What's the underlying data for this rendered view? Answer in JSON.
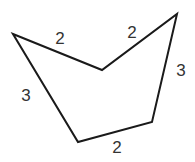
{
  "figure": {
    "type": "concave-pentagon",
    "stroke_color": "#1a1a1a",
    "label_color": "#333333",
    "background": "#ffffff",
    "vertices": [
      {
        "name": "left",
        "x": 13,
        "y": 34
      },
      {
        "name": "notch",
        "x": 102,
        "y": 70
      },
      {
        "name": "top-right",
        "x": 177,
        "y": 14
      },
      {
        "name": "bottom-right",
        "x": 152,
        "y": 122
      },
      {
        "name": "bottom-left",
        "x": 78,
        "y": 142
      }
    ],
    "sides": [
      {
        "id": "top-left",
        "from": "left",
        "to": "notch",
        "length": "2",
        "label_x": 60,
        "label_y": 38
      },
      {
        "id": "top-right",
        "from": "notch",
        "to": "top-right",
        "length": "2",
        "label_x": 132,
        "label_y": 32
      },
      {
        "id": "right",
        "from": "top-right",
        "to": "bottom-right",
        "length": "3",
        "label_x": 181,
        "label_y": 70
      },
      {
        "id": "bottom",
        "from": "bottom-right",
        "to": "bottom-left",
        "length": "2",
        "label_x": 117,
        "label_y": 147
      },
      {
        "id": "left",
        "from": "bottom-left",
        "to": "left",
        "length": "3",
        "label_x": 26,
        "label_y": 95
      }
    ]
  }
}
